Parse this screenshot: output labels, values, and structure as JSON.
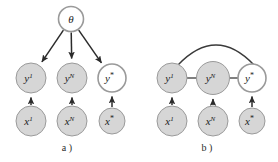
{
  "figure": {
    "name": "graphical-model-figure",
    "background": "#ffffff",
    "width": 278,
    "height": 162
  },
  "style": {
    "observed_fill": "#d6d6d6",
    "latent_fill": "#ffffff",
    "node_stroke": "#9a9a9a",
    "edge_color": "#2b2b2b",
    "text_color": "#1c1c1c"
  },
  "panels": [
    {
      "id": "panel-a",
      "caption": "a )",
      "caption_x": 67,
      "caption_y": 151,
      "nodes": [
        {
          "id": "theta",
          "base": "θ",
          "sup": "",
          "sup_italic": false,
          "cx": 71,
          "cy": 19,
          "r": 12.5,
          "filled": false
        },
        {
          "id": "y1",
          "base": "y",
          "sup": "1",
          "sup_italic": true,
          "cx": 31,
          "cy": 78,
          "r": 15,
          "filled": true
        },
        {
          "id": "yN",
          "base": "y",
          "sup": "N",
          "sup_italic": true,
          "cx": 72,
          "cy": 78,
          "r": 15,
          "filled": true
        },
        {
          "id": "ystar",
          "base": "y",
          "sup": "*",
          "sup_italic": false,
          "cx": 112,
          "cy": 78,
          "r": 14,
          "filled": false
        },
        {
          "id": "x1",
          "base": "x",
          "sup": "1",
          "sup_italic": true,
          "cx": 31,
          "cy": 121,
          "r": 15,
          "filled": true
        },
        {
          "id": "xN",
          "base": "x",
          "sup": "N",
          "sup_italic": true,
          "cx": 72,
          "cy": 121,
          "r": 15,
          "filled": true
        },
        {
          "id": "xstar",
          "base": "x",
          "sup": "*",
          "sup_italic": false,
          "cx": 112,
          "cy": 121,
          "r": 13,
          "filled": true
        }
      ],
      "directed_edges": [
        {
          "id": "theta-to-y1",
          "from": "theta",
          "to": "y1"
        },
        {
          "id": "theta-to-yN",
          "from": "theta",
          "to": "yN"
        },
        {
          "id": "theta-to-ystar",
          "from": "theta",
          "to": "ystar"
        },
        {
          "id": "x1-to-y1",
          "from": "x1",
          "to": "y1"
        },
        {
          "id": "xN-to-yN",
          "from": "xN",
          "to": "yN"
        },
        {
          "id": "xstar-to-ystar",
          "from": "xstar",
          "to": "ystar"
        }
      ],
      "undirected_edges": [],
      "arcs": []
    },
    {
      "id": "panel-b",
      "caption": "b )",
      "caption_x": 207,
      "caption_y": 151,
      "nodes": [
        {
          "id": "y1",
          "base": "y",
          "sup": "1",
          "sup_italic": true,
          "cx": 172,
          "cy": 78,
          "r": 15,
          "filled": true
        },
        {
          "id": "yN",
          "base": "y",
          "sup": "N",
          "sup_italic": true,
          "cx": 213,
          "cy": 78,
          "r": 16.5,
          "filled": true
        },
        {
          "id": "ystar",
          "base": "y",
          "sup": "*",
          "sup_italic": false,
          "cx": 252,
          "cy": 78,
          "r": 14,
          "filled": false
        },
        {
          "id": "x1",
          "base": "x",
          "sup": "1",
          "sup_italic": true,
          "cx": 172,
          "cy": 121,
          "r": 15,
          "filled": true
        },
        {
          "id": "xN",
          "base": "x",
          "sup": "N",
          "sup_italic": true,
          "cx": 213,
          "cy": 121,
          "r": 15,
          "filled": true
        },
        {
          "id": "xstar",
          "base": "x",
          "sup": "*",
          "sup_italic": false,
          "cx": 252,
          "cy": 121,
          "r": 13,
          "filled": true
        }
      ],
      "directed_edges": [
        {
          "id": "x1-to-y1",
          "from": "x1",
          "to": "y1"
        },
        {
          "id": "xN-to-yN",
          "from": "xN",
          "to": "yN"
        },
        {
          "id": "xstar-to-ystar",
          "from": "xstar",
          "to": "ystar"
        }
      ],
      "undirected_edges": [
        {
          "id": "y1-yN",
          "from": "y1",
          "to": "yN"
        },
        {
          "id": "yN-ystar",
          "from": "yN",
          "to": "ystar"
        }
      ],
      "arcs": [
        {
          "id": "y1-ystar-arc",
          "from": "y1",
          "to": "ystar",
          "bow": 40
        }
      ]
    }
  ]
}
